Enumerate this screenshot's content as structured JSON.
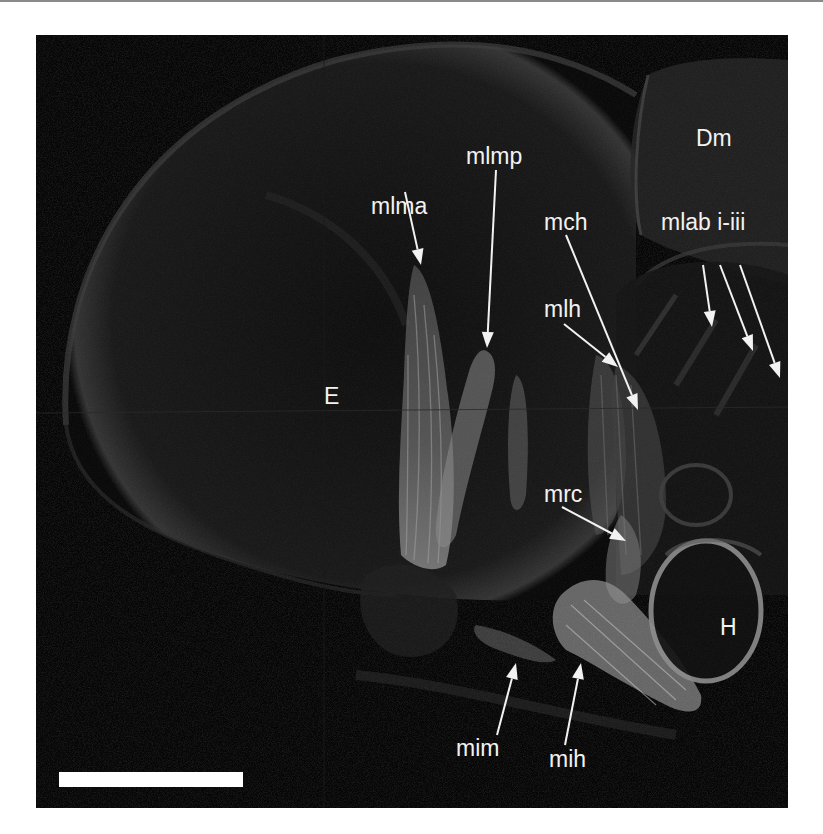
{
  "figure": {
    "background_color": "#050505",
    "label_color": "#f2f2f2",
    "labels": [
      {
        "id": "E",
        "text": "E",
        "x": 288,
        "y": 350
      },
      {
        "id": "Dm",
        "text": "Dm",
        "x": 660,
        "y": 92
      },
      {
        "id": "H",
        "text": "H",
        "x": 684,
        "y": 581
      },
      {
        "id": "mlma",
        "text": "mlma",
        "x": 335,
        "y": 160
      },
      {
        "id": "mlmp",
        "text": "mlmp",
        "x": 430,
        "y": 110
      },
      {
        "id": "mch",
        "text": "mch",
        "x": 508,
        "y": 176
      },
      {
        "id": "mlab",
        "text": "mlab i-iii",
        "x": 625,
        "y": 176
      },
      {
        "id": "mlh",
        "text": "mlh",
        "x": 508,
        "y": 263
      },
      {
        "id": "mrc",
        "text": "mrc",
        "x": 508,
        "y": 448
      },
      {
        "id": "mim",
        "text": "mim",
        "x": 420,
        "y": 702
      },
      {
        "id": "mih",
        "text": "mih",
        "x": 513,
        "y": 713
      }
    ],
    "arrows": [
      {
        "label": "mlma",
        "from": [
          369,
          157
        ],
        "to": [
          385,
          230
        ]
      },
      {
        "label": "mlmp",
        "from": [
          460,
          135
        ],
        "to": [
          451,
          313
        ]
      },
      {
        "label": "mch",
        "from": [
          530,
          200
        ],
        "to": [
          602,
          375
        ]
      },
      {
        "label": "mlab-i",
        "from": [
          667,
          230
        ],
        "to": [
          676,
          292
        ]
      },
      {
        "label": "mlab-ii",
        "from": [
          684,
          230
        ],
        "to": [
          717,
          316
        ]
      },
      {
        "label": "mlab-iii",
        "from": [
          704,
          230
        ],
        "to": [
          744,
          343
        ]
      },
      {
        "label": "mlh",
        "from": [
          528,
          289
        ],
        "to": [
          582,
          332
        ]
      },
      {
        "label": "mrc",
        "from": [
          526,
          472
        ],
        "to": [
          590,
          506
        ]
      },
      {
        "label": "mim",
        "from": [
          461,
          700
        ],
        "to": [
          480,
          628
        ]
      },
      {
        "label": "mih",
        "from": [
          529,
          710
        ],
        "to": [
          545,
          628
        ]
      }
    ],
    "scale_bar": {
      "x": 23,
      "y": 737,
      "width": 184,
      "height": 15,
      "color": "#ffffff"
    }
  }
}
